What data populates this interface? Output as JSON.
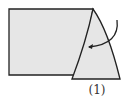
{
  "diagram": {
    "step_label": "(1)",
    "colors": {
      "paper_fill": "#e6e6e6",
      "outline": "#222222",
      "background": "#ffffff"
    },
    "elements": [
      "folded-paper-rectangle",
      "fold-flap-triangle",
      "fold-arrow"
    ]
  }
}
